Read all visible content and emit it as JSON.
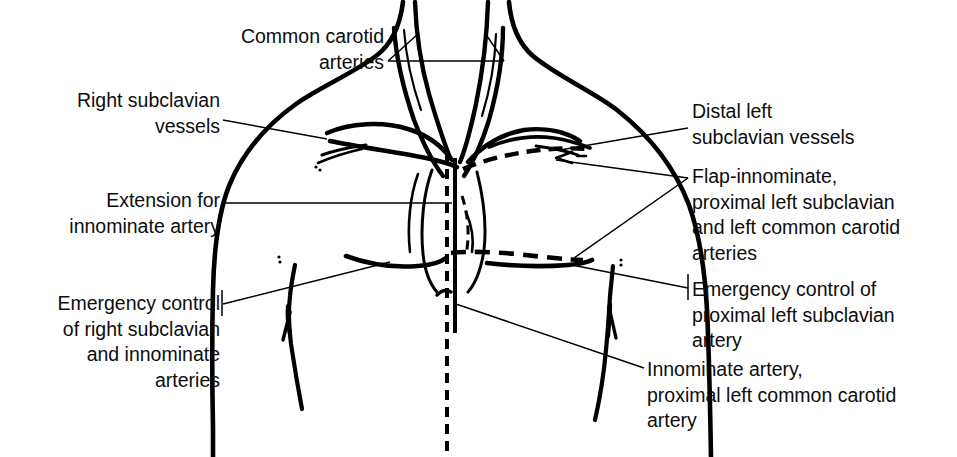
{
  "figure": {
    "type": "anatomical-line-diagram",
    "background_color": "#ffffff",
    "ink_color": "#000000",
    "width": 957,
    "height": 457
  },
  "labels": {
    "common_carotid": "Common carotid\narteries",
    "right_subclavian": "Right subclavian\nvessels",
    "extension_innominate": "Extension for\ninnominate artery",
    "emergency_right": "Emergency control\nof right subclavian\nand innominate\narteries",
    "distal_left_subclavian": "Distal left\nsubclavian vessels",
    "flap_innominate": "Flap-innominate,\nproximal left subclavian\nand left common carotid\narteries",
    "emergency_left": "Emergency control of\nproximal left subclavian\nartery",
    "innominate_artery": "Innominate artery,\nproximal left common carotid\nartery"
  },
  "anatomy_parts": [
    "neck-outline-left",
    "neck-outline-right",
    "common-carotid-artery-right",
    "common-carotid-artery-left",
    "internal-jugular-vein-right",
    "internal-jugular-vein-left",
    "trachea-midline",
    "sternum-midline-incision",
    "clavicle-right",
    "clavicle-left",
    "right-subclavian-vessels",
    "left-subclavian-vessels",
    "torso-outline-right",
    "torso-outline-left",
    "rib-margin-right",
    "rib-margin-left",
    "flap-incision-dashed",
    "supraclavicular-incision-dashed-left",
    "submammary-incision-dashed",
    "arrow-incision-right",
    "arrow-incision-left"
  ],
  "line_styles": {
    "body_outline": "solid-thick",
    "vessels": "solid-thick",
    "planned_incision": "dashed-thick",
    "leader_line": "solid-thin"
  }
}
